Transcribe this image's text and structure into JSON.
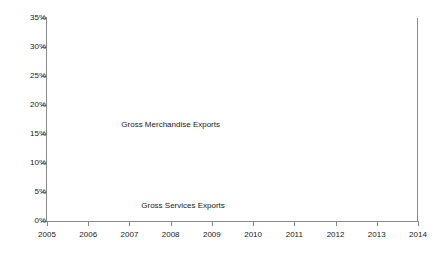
{
  "chart_data": {
    "type": "area",
    "stacked": true,
    "title": "",
    "xlabel": "",
    "ylabel": "% of GDP",
    "x": [
      2005,
      2006,
      2007,
      2008,
      2009,
      2010,
      2011,
      2012,
      2013,
      2014
    ],
    "categories": [
      "2005",
      "2006",
      "2007",
      "2008",
      "2009",
      "2010",
      "2011",
      "2012",
      "2013",
      "2014"
    ],
    "ylim": [
      0,
      35
    ],
    "yticks": [
      0,
      5,
      10,
      15,
      20,
      25,
      30,
      35
    ],
    "ytick_labels": [
      "0%",
      "5%",
      "10%",
      "15%",
      "20%",
      "25%",
      "30%",
      "35%"
    ],
    "grid": false,
    "legend_position": "inline-annotation",
    "series": [
      {
        "name": "Gross Services Exports",
        "color": "#8f8f8f",
        "values": [
          5.2,
          5.3,
          5.4,
          5.6,
          5.5,
          5.7,
          5.9,
          6.0,
          6.1,
          6.2
        ]
      },
      {
        "name": "Gross Merchandise Exports",
        "color": "#dcdcdc",
        "values": [
          22.8,
          24.5,
          25.0,
          26.4,
          22.0,
          24.1,
          25.3,
          25.2,
          25.1,
          25.0
        ]
      }
    ],
    "totals": [
      28.0,
      29.8,
      30.4,
      32.0,
      27.5,
      29.8,
      31.2,
      31.2,
      31.2,
      31.2
    ],
    "annotations": [
      {
        "text": "Gross Merchandise Exports",
        "x": 2008.0,
        "y": 16.5
      },
      {
        "text": "Gross Services Exports",
        "x": 2008.3,
        "y": 2.6
      }
    ],
    "axis_color": "#8a8a8a",
    "background": "#ffffff"
  }
}
